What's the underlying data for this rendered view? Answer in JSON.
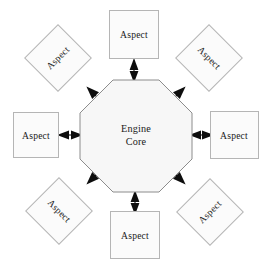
{
  "diagram": {
    "type": "hub-and-spoke",
    "background_color": "#ffffff",
    "node_fill_color": "#fbfbfb",
    "node_border_color": "#b5b5b5",
    "core_fill_color": "#f7f7f7",
    "core_border_color": "#8c8c8c",
    "arrow_color": "#0d0d0d",
    "center": {
      "name": "engine-core",
      "shape": "octagon",
      "label_line1": "Engine",
      "label_line2": "Core",
      "cx": 136,
      "cy": 136,
      "radius": 56
    },
    "nodes": [
      {
        "id": "aspect-top",
        "label": "Aspect",
        "shape": "square",
        "position": "top",
        "cx": 134,
        "cy": 34,
        "size": 49,
        "rotation": 0,
        "text_rotation": 0
      },
      {
        "id": "aspect-top-right",
        "label": "Aspect",
        "shape": "square",
        "position": "top-right",
        "cx": 209,
        "cy": 58,
        "size": 47,
        "rotation": 45,
        "text_rotation": 45
      },
      {
        "id": "aspect-right",
        "label": "Aspect",
        "shape": "square",
        "position": "right",
        "cx": 234,
        "cy": 135,
        "size": 48,
        "rotation": 0,
        "text_rotation": 0
      },
      {
        "id": "aspect-bottom-right",
        "label": "Aspect",
        "shape": "square",
        "position": "bottom-right",
        "cx": 210,
        "cy": 212,
        "size": 47,
        "rotation": 45,
        "text_rotation": -45
      },
      {
        "id": "aspect-bottom",
        "label": "Aspect",
        "shape": "square",
        "position": "bottom",
        "cx": 135,
        "cy": 235,
        "size": 49,
        "rotation": 0,
        "text_rotation": 0
      },
      {
        "id": "aspect-bottom-left",
        "label": "Aspect",
        "shape": "square",
        "position": "bottom-left",
        "cx": 59,
        "cy": 211,
        "size": 47,
        "rotation": 45,
        "text_rotation": 45
      },
      {
        "id": "aspect-left",
        "label": "Aspect",
        "shape": "square",
        "position": "left",
        "cx": 35,
        "cy": 135,
        "size": 45,
        "rotation": 0,
        "text_rotation": 0
      },
      {
        "id": "aspect-top-left",
        "label": "Aspect",
        "shape": "square",
        "position": "top-left",
        "cx": 58,
        "cy": 58,
        "size": 47,
        "rotation": 45,
        "text_rotation": -45
      }
    ],
    "connectors": [
      {
        "id": "connector-top",
        "from": "engine-core",
        "to": "aspect-top",
        "style": "double-headed-arrow",
        "angle_deg": 270
      },
      {
        "id": "connector-top-right",
        "from": "engine-core",
        "to": "aspect-top-right",
        "style": "double-headed-arrow",
        "angle_deg": 315
      },
      {
        "id": "connector-right",
        "from": "engine-core",
        "to": "aspect-right",
        "style": "double-headed-arrow",
        "angle_deg": 0
      },
      {
        "id": "connector-bottom-right",
        "from": "engine-core",
        "to": "aspect-bottom-right",
        "style": "double-headed-arrow",
        "angle_deg": 45
      },
      {
        "id": "connector-bottom",
        "from": "engine-core",
        "to": "aspect-bottom",
        "style": "double-headed-arrow",
        "angle_deg": 90
      },
      {
        "id": "connector-bottom-left",
        "from": "engine-core",
        "to": "aspect-bottom-left",
        "style": "double-headed-arrow",
        "angle_deg": 135
      },
      {
        "id": "connector-left",
        "from": "engine-core",
        "to": "aspect-left",
        "style": "double-headed-arrow",
        "angle_deg": 180
      },
      {
        "id": "connector-top-left",
        "from": "engine-core",
        "to": "aspect-top-left",
        "style": "double-headed-arrow",
        "angle_deg": 225
      }
    ]
  }
}
